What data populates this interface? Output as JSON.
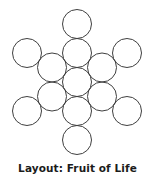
{
  "figure": {
    "caption": "Layout: Fruit of Life",
    "caption_prefix": "Layout:",
    "caption_name": "Fruit of Life",
    "background_color": "#ffffff",
    "stroke_color": "#3f3f3f",
    "fill_color": "none",
    "stroke_width": 1,
    "text_color": "#1b1b1b"
  },
  "diagram": {
    "type": "sacred-geometry-circle-packing",
    "name": "Fruit of Life",
    "circle_count": 13,
    "circle_radius": 14.5,
    "center": {
      "cx": 77,
      "cy": 82
    },
    "ring_radii": {
      "inner": 29,
      "outer": 58
    },
    "viewbox": {
      "width": 155,
      "height": 160
    },
    "circles": [
      {
        "id": "circle-center",
        "ring": "center",
        "index": 0,
        "cx": 77,
        "cy": 82,
        "r": 14.5
      },
      {
        "id": "circle-inner-n",
        "ring": "inner",
        "index": 1,
        "cx": 77,
        "cy": 53,
        "r": 14.5
      },
      {
        "id": "circle-inner-ne",
        "ring": "inner",
        "index": 2,
        "cx": 102,
        "cy": 67.5,
        "r": 14.5
      },
      {
        "id": "circle-inner-se",
        "ring": "inner",
        "index": 3,
        "cx": 102,
        "cy": 96.5,
        "r": 14.5
      },
      {
        "id": "circle-inner-s",
        "ring": "inner",
        "index": 4,
        "cx": 77,
        "cy": 111,
        "r": 14.5
      },
      {
        "id": "circle-inner-sw",
        "ring": "inner",
        "index": 5,
        "cx": 52,
        "cy": 96.5,
        "r": 14.5
      },
      {
        "id": "circle-inner-nw",
        "ring": "inner",
        "index": 6,
        "cx": 52,
        "cy": 67.5,
        "r": 14.5
      },
      {
        "id": "circle-outer-n",
        "ring": "outer",
        "index": 7,
        "cx": 77,
        "cy": 24,
        "r": 14.5
      },
      {
        "id": "circle-outer-ne",
        "ring": "outer",
        "index": 8,
        "cx": 127,
        "cy": 53,
        "r": 14.5
      },
      {
        "id": "circle-outer-se",
        "ring": "outer",
        "index": 9,
        "cx": 127,
        "cy": 111,
        "r": 14.5
      },
      {
        "id": "circle-outer-s",
        "ring": "outer",
        "index": 10,
        "cx": 77,
        "cy": 140,
        "r": 14.5
      },
      {
        "id": "circle-outer-sw",
        "ring": "outer",
        "index": 11,
        "cx": 27,
        "cy": 111,
        "r": 14.5
      },
      {
        "id": "circle-outer-nw",
        "ring": "outer",
        "index": 12,
        "cx": 27,
        "cy": 53,
        "r": 14.5
      }
    ]
  }
}
